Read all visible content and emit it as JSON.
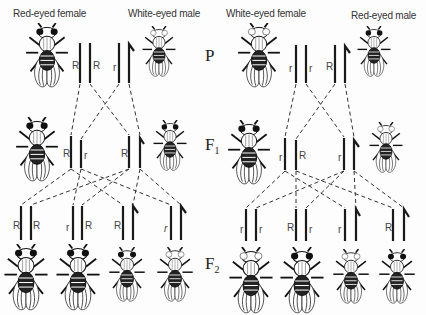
{
  "panels": {
    "left": {
      "female_title": "Red-eyed female",
      "male_title": "White-eyed male",
      "p_alleles": [
        "R",
        "R",
        "r"
      ],
      "f1_alleles": [
        "R",
        "r",
        "R"
      ],
      "f2_alleles": [
        "R",
        "R",
        "r",
        "R",
        "R",
        "r"
      ]
    },
    "right": {
      "female_title": "White-eyed female",
      "male_title": "Red-eyed male",
      "p_alleles": [
        "r",
        "r",
        "R"
      ],
      "f1_alleles": [
        "r",
        "R",
        "r"
      ],
      "f2_alleles": [
        "r",
        "r",
        "R",
        "r",
        "r",
        "R"
      ]
    }
  },
  "generations": {
    "p": "P",
    "f1_main": "F",
    "f1_sub": "1",
    "f2_main": "F",
    "f2_sub": "2"
  },
  "colors": {
    "ink": "#1a1a1a",
    "background": "#fdfdfd"
  }
}
